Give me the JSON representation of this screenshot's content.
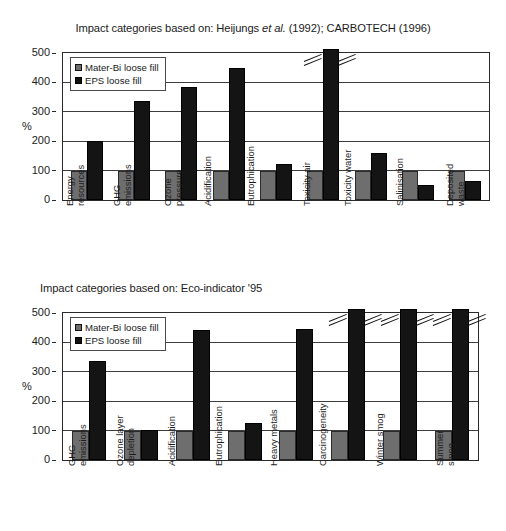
{
  "figure": {
    "percent_axis_label": "%"
  },
  "charts": [
    {
      "title_prefix": "Impact categories based on: Heijungs ",
      "title_italic": "et al.",
      "title_suffix": " (1992); CARBOTECH (1996)",
      "title_full": "Impact categories based on: Heijungs et al. (1992); CARBOTECH (1996)",
      "legend": [
        {
          "label": "Mater-Bi loose fill",
          "color": "#6e6e6e"
        },
        {
          "label": "EPS loose fill",
          "color": "#121212"
        }
      ],
      "chart_data": {
        "type": "bar",
        "title": "Impact categories based on: Heijungs et al. (1992); CARBOTECH (1996)",
        "xlabel": "",
        "ylabel": "%",
        "ylim": [
          0,
          500
        ],
        "yticks": [
          0,
          100,
          200,
          300,
          400,
          500
        ],
        "grid": true,
        "legend_position": "upper-left-inside",
        "categories": [
          "Energy resources",
          "GHG emissions",
          "Ozone pressure",
          "Acidification",
          "Eutrophication",
          "Toxicity air",
          "Toxicity water",
          "Salinisation",
          "Deposited waste"
        ],
        "category_lines": [
          [
            "Energy",
            "resources"
          ],
          [
            "GHG",
            "emissions"
          ],
          [
            "Ozone",
            "pressure"
          ],
          [
            "Acidification",
            ""
          ],
          [
            "Eutrophication",
            ""
          ],
          [
            "Toxicity air",
            ""
          ],
          [
            "Toxicity water",
            ""
          ],
          [
            "Salinisation",
            ""
          ],
          [
            "Deposited",
            "waste"
          ]
        ],
        "series": [
          {
            "name": "Mater-Bi loose fill",
            "values": [
              100,
              100,
              100,
              100,
              100,
              100,
              100,
              100,
              100
            ]
          },
          {
            "name": "EPS loose fill",
            "values": [
              200,
              337,
              383,
              448,
              123,
              512,
              161,
              52,
              65
            ]
          }
        ],
        "truncated_bars": [
          {
            "series": "EPS loose fill",
            "category": "Toxicity air",
            "note": "bar exceeds axis, axis-break mark shown"
          }
        ],
        "annotations": [
          "axis break slashes on Toxicity air EPS bar"
        ]
      }
    },
    {
      "title_prefix": "Impact categories based on: Eco-indicator '95",
      "title_italic": "",
      "title_suffix": "",
      "title_full": "Impact categories based on: Eco-indicator '95",
      "legend": [
        {
          "label": "Mater-Bi loose fill",
          "color": "#6e6e6e"
        },
        {
          "label": "EPS loose fill",
          "color": "#121212"
        }
      ],
      "chart_data": {
        "type": "bar",
        "title": "Impact categories based on: Eco-indicator '95",
        "xlabel": "",
        "ylabel": "%",
        "ylim": [
          0,
          500
        ],
        "yticks": [
          0,
          100,
          200,
          300,
          400,
          500
        ],
        "grid": true,
        "legend_position": "upper-left-inside",
        "categories": [
          "GHG emissions",
          "Ozone layer depletion",
          "Acidification",
          "Eutrophication",
          "Heavy metals",
          "Carcinogeneity",
          "Winter smog",
          "Summer smog"
        ],
        "category_lines": [
          [
            "GHG",
            "emissions"
          ],
          [
            "Ozone layer",
            "depletion"
          ],
          [
            "Acidification",
            ""
          ],
          [
            "Eutrophication",
            ""
          ],
          [
            "Heavy metals",
            ""
          ],
          [
            "Carcinogeneity",
            ""
          ],
          [
            "Winter smog",
            ""
          ],
          [
            "Summer",
            "smog"
          ]
        ],
        "series": [
          {
            "name": "Mater-Bi loose fill",
            "values": [
              100,
              100,
              100,
              100,
              100,
              100,
              100,
              100
            ]
          },
          {
            "name": "EPS loose fill",
            "values": [
              337,
              103,
              441,
              126,
              445,
              500,
              500,
              500
            ]
          }
        ],
        "truncated_bars": [
          {
            "series": "EPS loose fill",
            "category": "Carcinogeneity",
            "note": "bar exceeds axis, axis-break mark shown"
          },
          {
            "series": "EPS loose fill",
            "category": "Winter smog",
            "note": "bar exceeds axis, axis-break mark shown"
          },
          {
            "series": "EPS loose fill",
            "category": "Summer smog",
            "note": "bar exceeds axis, axis-break mark shown"
          }
        ],
        "annotations": [
          "axis break slashes on Carcinogeneity, Winter smog and Summer smog EPS bars"
        ]
      }
    }
  ]
}
